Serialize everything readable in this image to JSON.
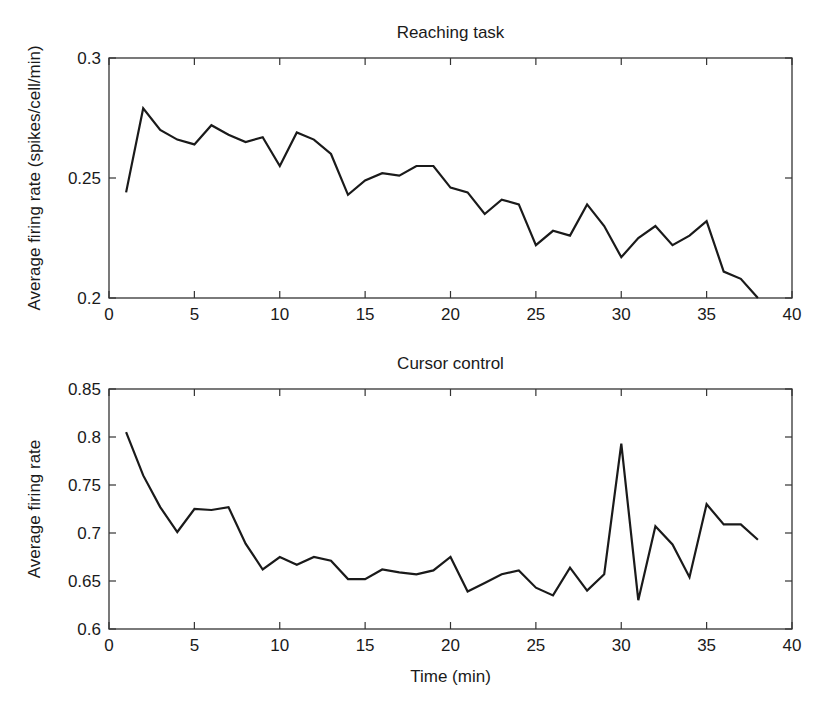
{
  "chart_data": [
    {
      "type": "line",
      "title": "Reaching task",
      "xlabel": "",
      "ylabel": "Average firing rate (spikes/cell/min)",
      "xlim": [
        0,
        40
      ],
      "ylim": [
        0.2,
        0.3
      ],
      "xticks": [
        0,
        5,
        10,
        15,
        20,
        25,
        30,
        35,
        40
      ],
      "yticks": [
        0.2,
        0.25,
        0.3
      ],
      "ytick_labels": [
        "0.2",
        "0.25",
        "0.3"
      ],
      "grid": false,
      "series": [
        {
          "name": "Reaching task",
          "color": "#1a1a1a",
          "x": [
            1,
            2,
            3,
            4,
            5,
            6,
            7,
            8,
            9,
            10,
            11,
            12,
            13,
            14,
            15,
            16,
            17,
            18,
            19,
            20,
            21,
            22,
            23,
            24,
            25,
            26,
            27,
            28,
            29,
            30,
            31,
            32,
            33,
            34,
            35,
            36,
            37,
            38
          ],
          "values": [
            0.244,
            0.279,
            0.27,
            0.266,
            0.264,
            0.272,
            0.268,
            0.265,
            0.267,
            0.255,
            0.269,
            0.266,
            0.26,
            0.243,
            0.249,
            0.252,
            0.251,
            0.255,
            0.255,
            0.246,
            0.244,
            0.235,
            0.241,
            0.239,
            0.222,
            0.228,
            0.226,
            0.239,
            0.23,
            0.217,
            0.225,
            0.23,
            0.222,
            0.226,
            0.232,
            0.211,
            0.208,
            0.2
          ]
        }
      ]
    },
    {
      "type": "line",
      "title": "Cursor control",
      "xlabel": "Time (min)",
      "ylabel": "Average firing rate",
      "xlim": [
        0,
        40
      ],
      "ylim": [
        0.6,
        0.85
      ],
      "xticks": [
        0,
        5,
        10,
        15,
        20,
        25,
        30,
        35,
        40
      ],
      "yticks": [
        0.6,
        0.65,
        0.7,
        0.75,
        0.8,
        0.85
      ],
      "ytick_labels": [
        "0.6",
        "0.65",
        "0.7",
        "0.75",
        "0.8",
        "0.85"
      ],
      "grid": false,
      "series": [
        {
          "name": "Cursor control",
          "color": "#1a1a1a",
          "x": [
            1,
            2,
            3,
            4,
            5,
            6,
            7,
            8,
            9,
            10,
            11,
            12,
            13,
            14,
            15,
            16,
            17,
            18,
            19,
            20,
            21,
            22,
            23,
            24,
            25,
            26,
            27,
            28,
            29,
            30,
            31,
            32,
            33,
            34,
            35,
            36,
            37,
            38
          ],
          "values": [
            0.805,
            0.76,
            0.727,
            0.701,
            0.725,
            0.724,
            0.727,
            0.689,
            0.662,
            0.675,
            0.667,
            0.675,
            0.671,
            0.652,
            0.652,
            0.662,
            0.659,
            0.657,
            0.661,
            0.675,
            0.639,
            0.648,
            0.657,
            0.661,
            0.643,
            0.635,
            0.664,
            0.64,
            0.657,
            0.793,
            0.63,
            0.707,
            0.688,
            0.654,
            0.73,
            0.709,
            0.709,
            0.693
          ]
        }
      ]
    }
  ],
  "layout": {
    "plots": [
      {
        "left": 109,
        "right": 792,
        "top": 58,
        "bottom": 298
      },
      {
        "left": 109,
        "right": 792,
        "top": 389,
        "bottom": 629
      }
    ],
    "line_color": "#1a1a1a",
    "axis_color": "#333333"
  }
}
